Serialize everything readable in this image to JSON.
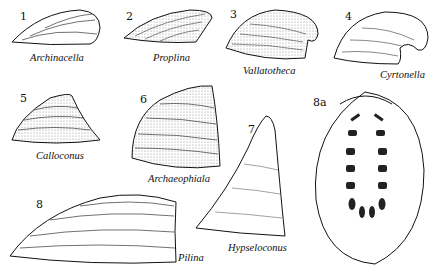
{
  "figure": {
    "specimens": [
      {
        "number": "1",
        "name": "Archinacella"
      },
      {
        "number": "2",
        "name": "Proplina"
      },
      {
        "number": "3",
        "name": "Vallatotheca"
      },
      {
        "number": "4",
        "name": "Cyrtonella"
      },
      {
        "number": "5",
        "name": "Calloconus"
      },
      {
        "number": "6",
        "name": "Archaeophiala"
      },
      {
        "number": "7",
        "name": "Hypseloconus"
      },
      {
        "number": "8",
        "name": "Pilina"
      },
      {
        "number": "8a",
        "name": ""
      }
    ],
    "colors": {
      "ink": "#111111",
      "background": "#ffffff",
      "stipple": "#888888"
    }
  }
}
